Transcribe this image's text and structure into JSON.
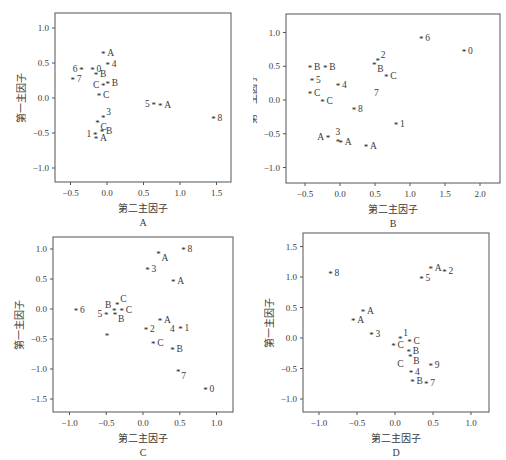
{
  "chart_data": [
    {
      "id": "A",
      "type": "scatter",
      "title": "",
      "panel_label": "A",
      "xlabel": "第二主因子",
      "ylabel": "第一主因子",
      "xlim": [
        -0.65,
        1.7
      ],
      "ylim": [
        -1.2,
        1.2
      ],
      "xticks": [
        -0.5,
        0.0,
        0.5,
        1.0,
        1.5
      ],
      "xtick_labels": [
        "−0.5",
        "0.0",
        "0.5",
        "1.0",
        "1.5"
      ],
      "yticks": [
        1.0,
        0.5,
        0.0,
        -0.5,
        -1.0
      ],
      "ytick_labels": [
        "1.0",
        "0.5",
        "0.0",
        "−0.5",
        "−1.0"
      ],
      "grid": false,
      "marker": "*",
      "points": [
        {
          "x": -0.05,
          "y": 0.64,
          "label": "A",
          "pos": "right"
        },
        {
          "x": 0.01,
          "y": 0.49,
          "label": "4",
          "pos": "right"
        },
        {
          "x": -0.35,
          "y": 0.41,
          "label": "6",
          "pos": "left"
        },
        {
          "x": -0.2,
          "y": 0.41,
          "label": "0",
          "pos": "right"
        },
        {
          "x": -0.15,
          "y": 0.34,
          "label": "B",
          "pos": "right"
        },
        {
          "x": -0.47,
          "y": 0.27,
          "label": "7",
          "pos": "right"
        },
        {
          "x": -0.05,
          "y": 0.19,
          "label": "C",
          "pos": "left"
        },
        {
          "x": 0.01,
          "y": 0.21,
          "label": "B",
          "pos": "right"
        },
        {
          "x": -0.11,
          "y": 0.05,
          "label": "C",
          "pos": "right"
        },
        {
          "x": 0.64,
          "y": -0.09,
          "label": "5",
          "pos": "left"
        },
        {
          "x": 0.73,
          "y": -0.1,
          "label": "A",
          "pos": "right"
        },
        {
          "x": 1.46,
          "y": -0.28,
          "label": "8",
          "pos": "right"
        },
        {
          "x": -0.05,
          "y": -0.27,
          "label": "3",
          "pos": "upright"
        },
        {
          "x": -0.13,
          "y": -0.34,
          "label": "C",
          "pos": "belowright"
        },
        {
          "x": -0.16,
          "y": -0.52,
          "label": "1",
          "pos": "left"
        },
        {
          "x": -0.07,
          "y": -0.47,
          "label": "B",
          "pos": "right"
        },
        {
          "x": -0.15,
          "y": -0.57,
          "label": "A",
          "pos": "right"
        }
      ],
      "frame": {
        "left": 55,
        "top": 13,
        "right": 231,
        "bottom": 182
      },
      "x0px": 107,
      "xscale": 73,
      "y0px": 98,
      "yscale": 70
    },
    {
      "id": "B",
      "type": "scatter",
      "title": "",
      "panel_label": "B",
      "xlabel": "第二主因子",
      "ylabel": "第一主因子",
      "xlim": [
        -0.75,
        2.3
      ],
      "ylim": [
        -1.25,
        1.25
      ],
      "xticks": [
        -0.5,
        0.0,
        0.5,
        1.0,
        1.5,
        2.0
      ],
      "xtick_labels": [
        "−0.5",
        "0.0",
        "0.5",
        "1.0",
        "1.5",
        "2.0"
      ],
      "yticks": [
        1.0,
        0.5,
        0.0,
        -0.5,
        -1.0
      ],
      "ytick_labels": [
        "1.0",
        "0.5",
        "0.0",
        "−0.5",
        "−1.0"
      ],
      "grid": false,
      "marker": "*",
      "points": [
        {
          "x": 1.16,
          "y": 0.92,
          "label": "6",
          "pos": "right"
        },
        {
          "x": 1.77,
          "y": 0.73,
          "label": "0",
          "pos": "right"
        },
        {
          "x": 0.54,
          "y": 0.59,
          "label": "2",
          "pos": "upright"
        },
        {
          "x": 0.49,
          "y": 0.53,
          "label": "B",
          "pos": "belowright"
        },
        {
          "x": -0.43,
          "y": 0.49,
          "label": "B",
          "pos": "right"
        },
        {
          "x": -0.21,
          "y": 0.49,
          "label": "B",
          "pos": "right"
        },
        {
          "x": 0.66,
          "y": 0.36,
          "label": "C",
          "pos": "right"
        },
        {
          "x": -0.4,
          "y": 0.3,
          "label": "5",
          "pos": "right"
        },
        {
          "x": -0.03,
          "y": 0.22,
          "label": "4",
          "pos": "right"
        },
        {
          "x": 0.52,
          "y": 0.1,
          "label": "7",
          "pos": "none",
          "marker": false
        },
        {
          "x": -0.43,
          "y": 0.11,
          "label": "C",
          "pos": "right"
        },
        {
          "x": -0.25,
          "y": -0.01,
          "label": "C",
          "pos": "right"
        },
        {
          "x": 0.2,
          "y": -0.13,
          "label": "8",
          "pos": "right"
        },
        {
          "x": 0.8,
          "y": -0.36,
          "label": "1",
          "pos": "right"
        },
        {
          "x": -0.17,
          "y": -0.55,
          "label": "A",
          "pos": "left"
        },
        {
          "x": -0.03,
          "y": -0.61,
          "label": "3",
          "pos": "above"
        },
        {
          "x": 0.01,
          "y": -0.62,
          "label": "A",
          "pos": "right"
        },
        {
          "x": 0.37,
          "y": -0.68,
          "label": "A",
          "pos": "right"
        }
      ],
      "frame": {
        "left": 33,
        "top": 14,
        "right": 247,
        "bottom": 183
      },
      "x0px": 87,
      "xscale": 70,
      "y0px": 100,
      "yscale": 67.5
    },
    {
      "id": "C",
      "type": "scatter",
      "title": "",
      "panel_label": "C",
      "xlabel": "第二主因子",
      "ylabel": "第一主因子",
      "xlim": [
        -1.2,
        1.2
      ],
      "ylim": [
        -1.7,
        1.2
      ],
      "xticks": [
        -1.0,
        -0.5,
        0.0,
        0.5,
        1.0
      ],
      "xtick_labels": [
        "−1.0",
        "−0.5",
        "0.0",
        "0.5",
        "1.0"
      ],
      "yticks": [
        1.0,
        0.5,
        0.0,
        -0.5,
        -1.0,
        -1.5
      ],
      "ytick_labels": [
        "1.0",
        "0.5",
        "0.0",
        "−0.5",
        "−1.0",
        "−1.5"
      ],
      "grid": false,
      "marker": "*",
      "points": [
        {
          "x": 0.55,
          "y": 1.0,
          "label": "8",
          "pos": "right"
        },
        {
          "x": 0.21,
          "y": 0.93,
          "label": "A",
          "pos": "belowright"
        },
        {
          "x": 0.06,
          "y": 0.67,
          "label": "3",
          "pos": "right"
        },
        {
          "x": 0.41,
          "y": 0.46,
          "label": "A",
          "pos": "right"
        },
        {
          "x": -0.91,
          "y": -0.01,
          "label": "6",
          "pos": "right"
        },
        {
          "x": -0.35,
          "y": 0.09,
          "label": "C",
          "pos": "upright"
        },
        {
          "x": -0.39,
          "y": -0.02,
          "label": "B",
          "pos": "upleft"
        },
        {
          "x": -0.29,
          "y": -0.02,
          "label": "C",
          "pos": "right"
        },
        {
          "x": -0.5,
          "y": -0.08,
          "label": "5",
          "pos": "left"
        },
        {
          "x": -0.38,
          "y": -0.09,
          "label": "B",
          "pos": "belowright"
        },
        {
          "x": 0.23,
          "y": -0.19,
          "label": "A",
          "pos": "right"
        },
        {
          "x": 0.04,
          "y": -0.33,
          "label": "2",
          "pos": "right"
        },
        {
          "x": 0.4,
          "y": -0.33,
          "label": "4",
          "pos": "none",
          "marker": false
        },
        {
          "x": 0.51,
          "y": -0.31,
          "label": "1",
          "pos": "right"
        },
        {
          "x": -0.49,
          "y": -0.43,
          "label": "",
          "pos": "none"
        },
        {
          "x": 0.14,
          "y": -0.56,
          "label": "C",
          "pos": "right"
        },
        {
          "x": 0.4,
          "y": -0.66,
          "label": "B",
          "pos": "right"
        },
        {
          "x": 0.48,
          "y": -1.04,
          "label": "7",
          "pos": "belowright"
        },
        {
          "x": 0.85,
          "y": -1.33,
          "label": "0",
          "pos": "right"
        }
      ],
      "frame": {
        "left": 53,
        "top": 7,
        "right": 233,
        "bottom": 182
      },
      "x0px": 143,
      "xscale": 73.5,
      "y0px": 79,
      "yscale": 60
    },
    {
      "id": "D",
      "type": "scatter",
      "title": "",
      "panel_label": "D",
      "xlabel": "第二主因子",
      "ylabel": "第一主因子",
      "xlim": [
        -1.2,
        1.2
      ],
      "ylim": [
        -1.2,
        1.7
      ],
      "xticks": [
        -1.0,
        -0.5,
        0.0,
        0.5,
        1.0
      ],
      "xtick_labels": [
        "−1.0",
        "−0.5",
        "0.0",
        "0.5",
        "1.0"
      ],
      "yticks": [
        1.5,
        1.0,
        0.5,
        0.0,
        -0.5,
        -1.0
      ],
      "ytick_labels": [
        "1.5",
        "1.0",
        "0.5",
        "0.0",
        "−0.5",
        "−1.0"
      ],
      "grid": false,
      "marker": "*",
      "points": [
        {
          "x": 0.47,
          "y": 1.14,
          "label": "A",
          "pos": "right"
        },
        {
          "x": 0.65,
          "y": 1.1,
          "label": "2",
          "pos": "right"
        },
        {
          "x": 0.35,
          "y": 0.99,
          "label": "5",
          "pos": "right"
        },
        {
          "x": -0.85,
          "y": 1.06,
          "label": "8",
          "pos": "right"
        },
        {
          "x": -0.42,
          "y": 0.45,
          "label": "A",
          "pos": "right"
        },
        {
          "x": -0.55,
          "y": 0.29,
          "label": "A",
          "pos": "right"
        },
        {
          "x": -0.31,
          "y": 0.06,
          "label": "3",
          "pos": "right"
        },
        {
          "x": 0.07,
          "y": 0.0,
          "label": "1",
          "pos": "upright"
        },
        {
          "x": 0.19,
          "y": -0.05,
          "label": "C",
          "pos": "right"
        },
        {
          "x": -0.02,
          "y": -0.12,
          "label": "C",
          "pos": "right"
        },
        {
          "x": 0.18,
          "y": -0.22,
          "label": "B",
          "pos": "right"
        },
        {
          "x": 0.2,
          "y": -0.3,
          "label": "B",
          "pos": "belowright"
        },
        {
          "x": 0.07,
          "y": -0.42,
          "label": "C",
          "pos": "none",
          "marker": false
        },
        {
          "x": 0.47,
          "y": -0.44,
          "label": "9",
          "pos": "right"
        },
        {
          "x": 0.21,
          "y": -0.55,
          "label": "4",
          "pos": "right"
        },
        {
          "x": 0.23,
          "y": -0.7,
          "label": "B",
          "pos": "right"
        },
        {
          "x": 0.41,
          "y": -0.74,
          "label": "7",
          "pos": "right"
        }
      ],
      "frame": {
        "left": 50,
        "top": 3,
        "right": 236,
        "bottom": 182
      },
      "x0px": 142,
      "xscale": 76,
      "y0px": 108,
      "yscale": 61
    }
  ],
  "panels": [
    {
      "id": "A",
      "caption": "A",
      "xlabel": "第二主因子",
      "ylabel": "第一主因子"
    },
    {
      "id": "B",
      "caption": "B",
      "xlabel": "第二主因子",
      "ylabel": "第一主因子"
    },
    {
      "id": "C",
      "caption": "C",
      "xlabel": "第二主因子",
      "ylabel": "第一主因子"
    },
    {
      "id": "D",
      "caption": "D",
      "xlabel": "第二主因子",
      "ylabel": "第一主因子"
    }
  ]
}
